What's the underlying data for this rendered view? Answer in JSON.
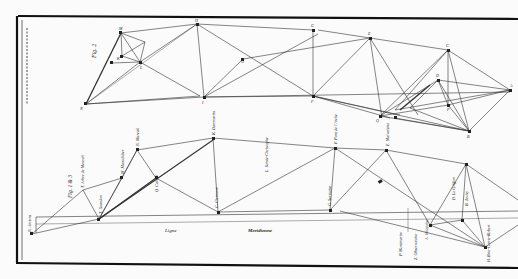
{
  "plate": {
    "background": "#fbfbfb",
    "ink": "#2a2a2a",
    "border": "#111111",
    "margin_caption": "Mém. de l'Acad. R. des Sc. ... Pl. ..."
  },
  "fig2": {
    "label": "Fig. 2",
    "stations": [
      {
        "id": "N",
        "label": "N"
      },
      {
        "id": "M",
        "label": "M"
      },
      {
        "id": "K",
        "label": "K"
      },
      {
        "id": "L",
        "label": "L"
      },
      {
        "id": "I",
        "label": "I"
      },
      {
        "id": "H",
        "label": "H"
      },
      {
        "id": "G",
        "label": "G"
      },
      {
        "id": "O",
        "label": "O"
      },
      {
        "id": "F",
        "label": "F"
      },
      {
        "id": "E",
        "label": "E"
      },
      {
        "id": "D",
        "label": "D"
      },
      {
        "id": "C",
        "label": "C"
      },
      {
        "id": "B",
        "label": "B"
      },
      {
        "id": "A",
        "label": "A"
      },
      {
        "id": "Q",
        "label": "Q"
      },
      {
        "id": "P",
        "label": "P"
      }
    ]
  },
  "fig1": {
    "label": "Fig. 1 & 3",
    "baseline_words": [
      "Ligne",
      "Meridienne"
    ],
    "stations": [
      {
        "id": "N",
        "label": "N. Amiens"
      },
      {
        "id": "T",
        "label": "T. Arbre de Mereuil"
      },
      {
        "id": "X",
        "label": "X. Sourdon"
      },
      {
        "id": "M",
        "label": "M. Montdidier"
      },
      {
        "id": "N2",
        "label": "N. Mareuil"
      },
      {
        "id": "Q",
        "label": "Q. Coivrel"
      },
      {
        "id": "L",
        "label": "L. Sainte-Christophe"
      },
      {
        "id": "C",
        "label": "C. Clermont"
      },
      {
        "id": "R",
        "label": "R. St. Christophe"
      },
      {
        "id": "K",
        "label": "K. Dammartin"
      },
      {
        "id": "G",
        "label": "G. Sermoise"
      },
      {
        "id": "F",
        "label": "F. Pont de l'Arche"
      },
      {
        "id": "E",
        "label": "E. Malvoisine"
      },
      {
        "id": "D",
        "label": "D. Le Griffon"
      },
      {
        "id": "A",
        "label": "A. Villejuive"
      },
      {
        "id": "B",
        "label": "B. Juvisy"
      },
      {
        "id": "P",
        "label": "P. Montmartre"
      },
      {
        "id": "Z",
        "label": "Z. Observatoire"
      },
      {
        "id": "H",
        "label": "H. Brie-Comte-Robert"
      }
    ],
    "markers": [
      "β",
      "γ",
      "δ",
      "ε",
      "ζ"
    ]
  }
}
